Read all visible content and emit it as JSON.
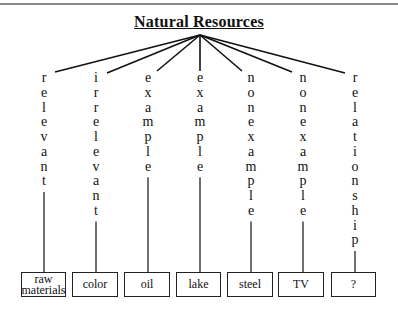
{
  "title": "Natural Resources",
  "columns": [
    {
      "word": "relevant",
      "box": "raw materials",
      "center_x": 44,
      "box_left": 21,
      "box_right": 66,
      "ray_end": [
        55,
        72
      ]
    },
    {
      "word": "irrelevant",
      "box": "color",
      "center_x": 96,
      "box_left": 72,
      "box_right": 118,
      "ray_end": [
        107,
        73
      ]
    },
    {
      "word": "example",
      "box": "oil",
      "center_x": 148,
      "box_left": 124,
      "box_right": 170,
      "ray_end": [
        157,
        71
      ]
    },
    {
      "word": "example",
      "box": "lake",
      "center_x": 200,
      "box_left": 176,
      "box_right": 221,
      "ray_end": [
        200,
        71
      ]
    },
    {
      "word": "nonexample",
      "box": "steel",
      "center_x": 251,
      "box_left": 227,
      "box_right": 273,
      "ray_end": [
        242,
        71
      ]
    },
    {
      "word": "nonexample",
      "box": "TV",
      "center_x": 303,
      "box_left": 278,
      "box_right": 324,
      "ray_end": [
        292,
        72
      ]
    },
    {
      "word": "relationship",
      "box": "?",
      "center_x": 355,
      "box_left": 331,
      "box_right": 376,
      "ray_end": [
        345,
        73
      ]
    }
  ],
  "hub": [
    200,
    35
  ],
  "colors": {
    "line": "#111111",
    "rule": "#8a8a8a"
  }
}
